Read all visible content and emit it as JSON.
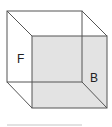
{
  "diagram": {
    "type": "wireframe-cube",
    "labels": {
      "front_face": "F",
      "back_face": "B"
    },
    "colors": {
      "edge": "#555555",
      "shaded_face": "#e3e3e3",
      "background": "#ffffff",
      "underline": "#d8d8d8"
    }
  }
}
